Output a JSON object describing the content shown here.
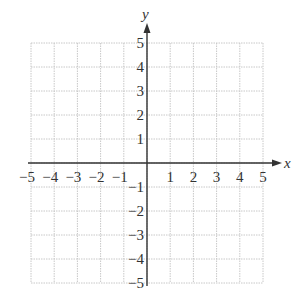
{
  "chart_data": {
    "type": "scatter",
    "title": "",
    "xlabel": "x",
    "ylabel": "y",
    "xlim": [
      -5,
      5
    ],
    "ylim": [
      -5,
      5
    ],
    "grid": true,
    "x_ticks": [
      "−5",
      "−4",
      "−3",
      "−2",
      "−1",
      "1",
      "2",
      "3",
      "4",
      "5"
    ],
    "y_ticks": [
      "5",
      "4",
      "3",
      "2",
      "1",
      "−1",
      "−2",
      "−3",
      "−4",
      "−5"
    ],
    "series": []
  },
  "axes": {
    "x_label": "x",
    "y_label": "y"
  },
  "colors": {
    "grid": "#c8c8c8",
    "axis": "#333333"
  }
}
